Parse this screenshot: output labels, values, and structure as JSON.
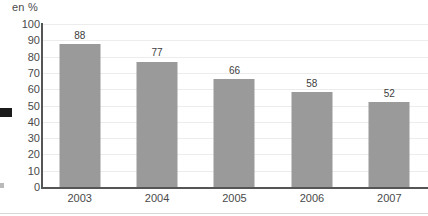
{
  "chart_data": {
    "type": "bar",
    "title": "",
    "subtitle": "",
    "xlabel": "",
    "ylabel": "en %",
    "categories": [
      "2003",
      "2004",
      "2005",
      "2006",
      "2007"
    ],
    "values": [
      88,
      77,
      66,
      58,
      52
    ],
    "series": [
      {
        "name": "",
        "values": [
          88,
          77,
          66,
          58,
          52
        ]
      }
    ],
    "ylim": [
      0,
      100
    ],
    "ytick_labels": [
      "100",
      "90",
      "80",
      "70",
      "60",
      "50",
      "40",
      "30",
      "20",
      "10",
      "0"
    ],
    "ytick_values": [
      100,
      90,
      80,
      70,
      60,
      50,
      40,
      30,
      20,
      10,
      0
    ],
    "ytick_step": 10,
    "grid": true,
    "grid_axis": "y",
    "legend": false,
    "legend_position": "none",
    "data_labels": true,
    "colors": {
      "bar": "#9a9a9a",
      "gridline": "#ececec",
      "axis": "#555555",
      "text": "#4a4a4a",
      "data_label": "#3d3d3d",
      "background": "#ffffff"
    }
  }
}
